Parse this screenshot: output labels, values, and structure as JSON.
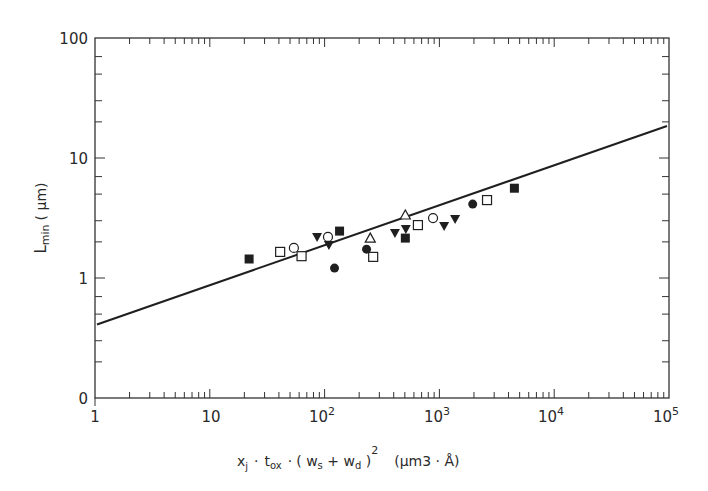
{
  "chart_data": {
    "type": "scatter",
    "title": "",
    "xlabel": "x_j · t_ox · (w_s + w_d)^2  (µm3 · Å)",
    "ylabel": "L_min (µm)",
    "xscale": "log",
    "yscale": "log",
    "xlim": [
      1,
      100000
    ],
    "ylim": [
      0.1,
      100
    ],
    "grid": false,
    "legend": null,
    "x_tick_labels": [
      "1",
      "10",
      "10^2",
      "10^3",
      "10^4",
      "10^5"
    ],
    "y_tick_labels": [
      "0",
      "1",
      "10",
      "100"
    ],
    "fit_line": {
      "description": "L_min = 0.4 (x_j t_ox (w_s+w_d)^2)^(1/3)",
      "x": [
        1,
        100000
      ],
      "y": [
        0.41,
        18.5
      ]
    },
    "series": [
      {
        "name": "filled-square",
        "marker": "square-filled",
        "points": [
          [
            22,
            1.44
          ],
          [
            135,
            2.46
          ],
          [
            505,
            2.15
          ],
          [
            4500,
            5.6
          ]
        ]
      },
      {
        "name": "open-square",
        "marker": "square-open",
        "points": [
          [
            41,
            1.65
          ],
          [
            63,
            1.52
          ],
          [
            265,
            1.5
          ],
          [
            650,
            2.76
          ],
          [
            2600,
            4.46
          ]
        ]
      },
      {
        "name": "open-circle",
        "marker": "circle-open",
        "points": [
          [
            54,
            1.78
          ],
          [
            107,
            2.2
          ],
          [
            880,
            3.16
          ]
        ]
      },
      {
        "name": "filled-circle",
        "marker": "circle-filled",
        "points": [
          [
            122,
            1.21
          ],
          [
            232,
            1.74
          ],
          [
            1950,
            4.13
          ]
        ]
      },
      {
        "name": "filled-triangle-down",
        "marker": "triangle-down-filled",
        "points": [
          [
            86,
            2.2
          ],
          [
            109,
            1.88
          ],
          [
            410,
            2.37
          ],
          [
            510,
            2.56
          ],
          [
            1100,
            2.71
          ],
          [
            1370,
            3.1
          ]
        ]
      },
      {
        "name": "open-triangle-up",
        "marker": "triangle-up-open",
        "points": [
          [
            250,
            2.15
          ],
          [
            505,
            3.35
          ]
        ]
      }
    ]
  },
  "axes": {
    "x": {
      "ticks": [
        {
          "label": "1",
          "sup": ""
        },
        {
          "label": "10",
          "sup": ""
        },
        {
          "label": "10",
          "sup": "2"
        },
        {
          "label": "10",
          "sup": "3"
        },
        {
          "label": "10",
          "sup": "4"
        },
        {
          "label": "10",
          "sup": "5"
        }
      ],
      "label_parts": {
        "xj": "x",
        "xj_sub": "j",
        "dot1": "·",
        "tox": "t",
        "tox_sub": "ox",
        "dot2": "·",
        "paren_open": "( ",
        "ws": "w",
        "ws_sub": "s",
        "plus": " + ",
        "wd": "w",
        "wd_sub": "d",
        "paren_close": " )",
        "square": "2",
        "unit": "(µm3 · Å)"
      }
    },
    "y": {
      "ticks": [
        "0",
        "1",
        "10",
        "100"
      ],
      "label_main": "L",
      "label_sub": "min",
      "label_unit": "( µm)"
    }
  }
}
